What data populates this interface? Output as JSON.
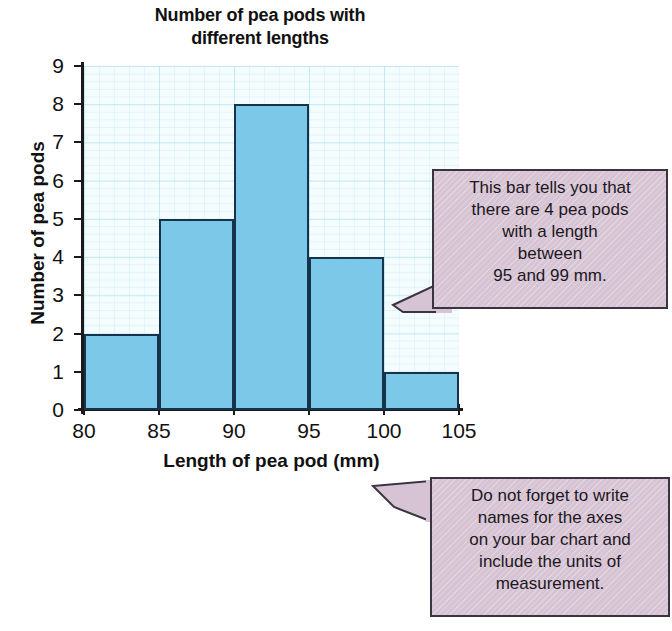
{
  "chart_data": {
    "type": "bar",
    "title": "Number of pea pods with different lengths",
    "title_lines": [
      "Number of pea pods with",
      "different lengths"
    ],
    "xlabel": "Length of pea pod (mm)",
    "ylabel": "Number of pea pods",
    "categories": [
      "80-85",
      "85-90",
      "90-95",
      "95-100",
      "100-105"
    ],
    "bin_edges": [
      80,
      85,
      90,
      95,
      100,
      105
    ],
    "values": [
      2,
      5,
      8,
      4,
      1
    ],
    "xlim": [
      80,
      105
    ],
    "ylim": [
      0,
      9
    ],
    "xticks": [
      "80",
      "85",
      "90",
      "95",
      "100",
      "105"
    ],
    "yticks": [
      "0",
      "1",
      "2",
      "3",
      "4",
      "5",
      "6",
      "7",
      "8",
      "9"
    ],
    "grid": true,
    "legend": "none",
    "bar_color": "#7cc8e8",
    "bar_edge_color": "#17334a",
    "grid_color": "#5abedc",
    "annotations": [
      "This bar tells you that there are 4 pea pods with a length between 95 and 99 mm.",
      "Do not forget to write names for the axes on your bar chart and include the units of measurement."
    ]
  },
  "callouts": {
    "bar_note": {
      "lines": [
        "This bar tells you that",
        "there are 4 pea pods",
        "with a length",
        "between",
        "95 and 99 mm."
      ],
      "bg_color": "#d6c4d4"
    },
    "axes_note": {
      "lines": [
        "Do not forget to write",
        "names for the axes",
        "on your bar chart and",
        "include the units of",
        "measurement."
      ],
      "bg_color": "#d6c4d4"
    }
  }
}
